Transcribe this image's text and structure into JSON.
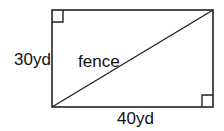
{
  "diagram": {
    "type": "rectangle-with-diagonal",
    "labels": {
      "left_side": "30yd",
      "bottom_side": "40yd",
      "diagonal": "fence"
    },
    "geometry": {
      "rect": {
        "x": 52,
        "y": 10,
        "width": 161,
        "height": 97
      },
      "diagonal": {
        "from": "bottom-left",
        "to": "top-right"
      },
      "right_angle_markers": [
        "top-left",
        "bottom-right"
      ]
    },
    "colors": {
      "stroke": "#222222",
      "background": "#ffffff",
      "text": "#111111"
    }
  }
}
